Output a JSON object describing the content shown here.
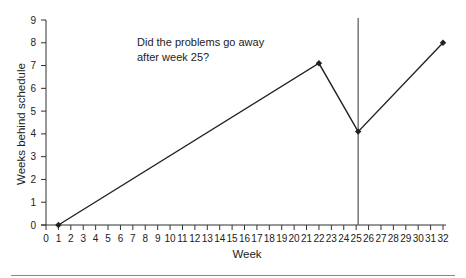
{
  "chart_data": {
    "type": "line",
    "title": "",
    "xlabel": "Week",
    "ylabel": "Weeks behind schedule",
    "xlim": [
      0,
      32
    ],
    "ylim": [
      0,
      9
    ],
    "x_ticks": [
      0,
      1,
      2,
      3,
      4,
      5,
      6,
      7,
      8,
      9,
      10,
      11,
      12,
      13,
      14,
      15,
      16,
      17,
      18,
      19,
      20,
      21,
      22,
      23,
      24,
      25,
      26,
      27,
      28,
      29,
      30,
      31,
      32
    ],
    "y_ticks": [
      0,
      1,
      2,
      3,
      4,
      5,
      6,
      7,
      8,
      9
    ],
    "grid": false,
    "legend": null,
    "series": [
      {
        "name": "Weeks behind schedule",
        "x": [
          1,
          22,
          25,
          32
        ],
        "values": [
          0,
          7.1,
          4.1,
          8.0
        ],
        "marker": "diamond",
        "color": "#222222"
      }
    ],
    "reference_lines": [
      {
        "orientation": "vertical",
        "x": 25,
        "color": "#555555"
      }
    ],
    "annotations": [
      {
        "text_lines": [
          "Did the problems go away",
          "after week 25?"
        ],
        "x": 10,
        "y": 8
      }
    ]
  }
}
